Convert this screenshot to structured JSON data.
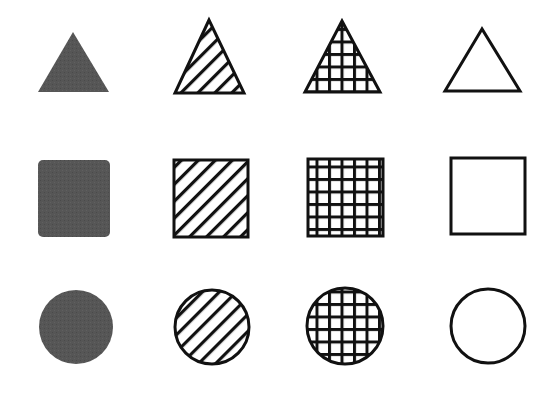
{
  "diagram": {
    "background": "#ffffff",
    "stroke_color": "#111111",
    "solid_fill_color": "#555555",
    "rows": [
      {
        "shape": "triangle",
        "items": [
          {
            "fill": "solid",
            "points": [
              [
                73,
                32
              ],
              [
                38,
                92
              ],
              [
                109,
                92
              ]
            ]
          },
          {
            "fill": "hatch",
            "points": [
              [
                209,
                20
              ],
              [
                175,
                93
              ],
              [
                244,
                93
              ]
            ]
          },
          {
            "fill": "grid",
            "points": [
              [
                342,
                21
              ],
              [
                305,
                92
              ],
              [
                380,
                92
              ]
            ]
          },
          {
            "fill": "none",
            "points": [
              [
                482,
                29
              ],
              [
                445,
                91
              ],
              [
                520,
                91
              ]
            ]
          }
        ]
      },
      {
        "shape": "square",
        "items": [
          {
            "fill": "solid",
            "x": 38,
            "y": 160,
            "w": 72,
            "h": 77,
            "r": 5
          },
          {
            "fill": "hatch",
            "x": 174,
            "y": 160,
            "w": 74,
            "h": 77,
            "r": 0
          },
          {
            "fill": "grid",
            "x": 308,
            "y": 159,
            "w": 75,
            "h": 77,
            "r": 0
          },
          {
            "fill": "none",
            "x": 451,
            "y": 158,
            "w": 74,
            "h": 76,
            "r": 0
          }
        ]
      },
      {
        "shape": "circle",
        "items": [
          {
            "fill": "solid",
            "cx": 76,
            "cy": 327,
            "r": 37
          },
          {
            "fill": "hatch",
            "cx": 212,
            "cy": 327,
            "r": 37
          },
          {
            "fill": "grid",
            "cx": 345,
            "cy": 326,
            "r": 38
          },
          {
            "fill": "none",
            "cx": 488,
            "cy": 326,
            "r": 37
          }
        ]
      }
    ],
    "fill_types": [
      "solid",
      "hatch",
      "grid",
      "none"
    ]
  }
}
